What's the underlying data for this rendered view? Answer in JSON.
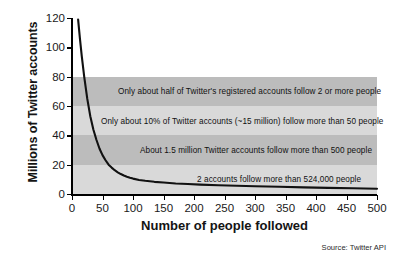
{
  "chart_data": {
    "type": "line",
    "title": "",
    "xlabel": "Number of people followed",
    "ylabel": "Millions of Twitter accounts",
    "xlim": [
      0,
      500
    ],
    "ylim": [
      0,
      120
    ],
    "grid": false,
    "legend": "none",
    "source": "Source: Twitter API",
    "xticks": [
      "0",
      "50",
      "100",
      "150",
      "200",
      "250",
      "300",
      "350",
      "400",
      "450",
      "500"
    ],
    "xtick_values": [
      0,
      50,
      100,
      150,
      200,
      250,
      300,
      350,
      400,
      450,
      500
    ],
    "yticks": [
      "0",
      "20",
      "40",
      "60",
      "80",
      "100",
      "120"
    ],
    "ytick_values": [
      0,
      20,
      40,
      60,
      80,
      100,
      120
    ],
    "series": [
      {
        "name": "Twitter accounts by number followed",
        "color": "#111111",
        "x": [
          10,
          13,
          16,
          20,
          25,
          30,
          35,
          40,
          45,
          50,
          55,
          60,
          65,
          70,
          75,
          80,
          85,
          90,
          95,
          100,
          110,
          120,
          135,
          150,
          170,
          190,
          210,
          240,
          270,
          300,
          340,
          380,
          420,
          460,
          500
        ],
        "y": [
          119,
          106,
          94,
          80,
          65,
          53,
          44,
          37,
          31,
          26.5,
          23,
          20,
          18,
          16.2,
          14.8,
          13.6,
          12.6,
          11.8,
          11.1,
          10.5,
          9.6,
          9.0,
          8.3,
          7.8,
          7.2,
          6.8,
          6.4,
          6.0,
          5.6,
          5.3,
          4.9,
          4.5,
          4.2,
          3.9,
          3.6
        ]
      }
    ],
    "bands": [
      {
        "name": "band-80-60",
        "shade": "dark",
        "y_from": 80,
        "y_to": 60,
        "color": "#bcbcbc"
      },
      {
        "name": "band-60-40",
        "shade": "light",
        "y_from": 60,
        "y_to": 40,
        "color": "#d9d9d9"
      },
      {
        "name": "band-40-20",
        "shade": "dark",
        "y_from": 40,
        "y_to": 20,
        "color": "#bcbcbc"
      },
      {
        "name": "band-20-0",
        "shade": "light",
        "y_from": 20,
        "y_to": 0,
        "color": "#d9d9d9"
      }
    ],
    "annotations": [
      {
        "text": "Only about half of Twitter's registered accounts follow 2 or more people",
        "x_px": 118,
        "y_value": 70
      },
      {
        "text": "Only about 10% of Twitter accounts (~15 million) follow more than 50 people",
        "x_px": 101,
        "y_value": 50
      },
      {
        "text": "About 1.5 million Twitter accounts follow more than 500 people",
        "x_px": 140,
        "y_value": 30
      },
      {
        "text": "2 accounts follow more than 524,000 people",
        "x_px": 197,
        "y_value": 10
      }
    ]
  }
}
